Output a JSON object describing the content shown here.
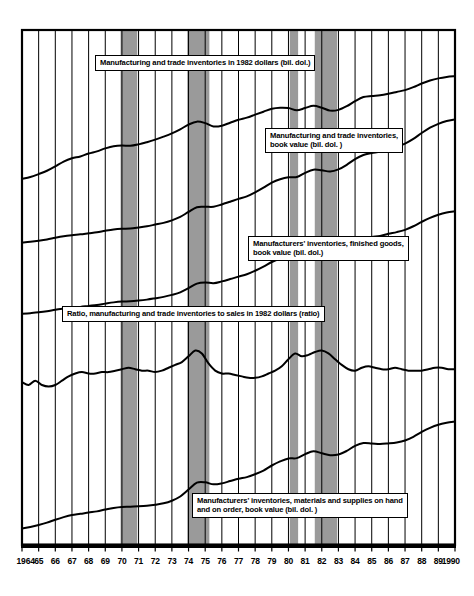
{
  "figure": {
    "background": "#ffffff",
    "plot_frame_color": "#000000",
    "grid_color": "#000000",
    "recession_fill": "#9a9a9a",
    "line_color": "#000000"
  },
  "chart_data": {
    "type": "line",
    "title": "",
    "subtitle": "",
    "xlabel": "",
    "ylabel": "",
    "grid": true,
    "legend_position": "inline-labels",
    "xlim": [
      1964,
      1990
    ],
    "x_tick_labels": [
      "1964",
      "65",
      "66",
      "67",
      "68",
      "69",
      "70",
      "71",
      "72",
      "73",
      "74",
      "75",
      "76",
      "77",
      "78",
      "79",
      "80",
      "81",
      "82",
      "83",
      "84",
      "85",
      "86",
      "87",
      "88",
      "89",
      "1990"
    ],
    "x_ticks": [
      1964,
      1965,
      1966,
      1967,
      1968,
      1969,
      1970,
      1971,
      1972,
      1973,
      1974,
      1975,
      1976,
      1977,
      1978,
      1979,
      1980,
      1981,
      1982,
      1983,
      1984,
      1985,
      1986,
      1987,
      1988,
      1989,
      1990
    ],
    "shaded_bands": [
      {
        "name": "recession-1969-1970",
        "start": 1969.92,
        "end": 1970.92
      },
      {
        "name": "recession-1973-1975",
        "start": 1973.92,
        "end": 1975.25
      },
      {
        "name": "recession-1980",
        "start": 1980.08,
        "end": 1980.58
      },
      {
        "name": "recession-1981-1982",
        "start": 1981.58,
        "end": 1982.92
      }
    ],
    "series": [
      {
        "name": "Manufacturing and trade inventories in 1982 dollars (bil. dol.)",
        "id": "mfg-trade-inv-1982-dollars",
        "x": [
          1964.0,
          1964.5,
          1965.0,
          1965.5,
          1966.0,
          1966.5,
          1967.0,
          1967.5,
          1968.0,
          1968.5,
          1969.0,
          1969.5,
          1970.0,
          1970.5,
          1971.0,
          1971.5,
          1972.0,
          1972.5,
          1973.0,
          1973.5,
          1974.0,
          1974.5,
          1975.0,
          1975.5,
          1976.0,
          1976.5,
          1977.0,
          1977.5,
          1978.0,
          1978.5,
          1979.0,
          1979.5,
          1980.0,
          1980.5,
          1981.0,
          1981.5,
          1982.0,
          1982.5,
          1983.0,
          1983.5,
          1984.0,
          1984.5,
          1985.0,
          1985.5,
          1986.0,
          1986.5,
          1987.0,
          1987.5,
          1988.0,
          1988.5,
          1989.0,
          1989.5,
          1990.0
        ],
        "y": [
          218,
          223,
          231,
          240,
          252,
          265,
          274,
          279,
          287,
          293,
          301,
          307,
          309,
          308,
          312,
          318,
          325,
          333,
          342,
          353,
          366,
          374,
          370,
          361,
          363,
          371,
          379,
          385,
          393,
          401,
          409,
          412,
          411,
          405,
          411,
          417,
          412,
          404,
          406,
          416,
          430,
          441,
          444,
          446,
          450,
          455,
          460,
          468,
          478,
          486,
          492,
          496,
          498
        ]
      },
      {
        "name": "Manufacturing and trade inventories, book value (bil. dol. )",
        "id": "mfg-trade-inv-book-value",
        "x": [
          1964.0,
          1964.5,
          1965.0,
          1965.5,
          1966.0,
          1966.5,
          1967.0,
          1967.5,
          1968.0,
          1968.5,
          1969.0,
          1969.5,
          1970.0,
          1970.5,
          1971.0,
          1971.5,
          1972.0,
          1972.5,
          1973.0,
          1973.5,
          1974.0,
          1974.5,
          1975.0,
          1975.5,
          1976.0,
          1976.5,
          1977.0,
          1977.5,
          1978.0,
          1978.5,
          1979.0,
          1979.5,
          1980.0,
          1980.5,
          1981.0,
          1981.5,
          1982.0,
          1982.5,
          1983.0,
          1983.5,
          1984.0,
          1984.5,
          1985.0,
          1985.5,
          1986.0,
          1986.5,
          1987.0,
          1987.5,
          1988.0,
          1988.5,
          1989.0,
          1989.5,
          1990.0
        ],
        "y": [
          103,
          107,
          112,
          118,
          126,
          133,
          138,
          142,
          147,
          152,
          159,
          165,
          168,
          169,
          174,
          180,
          188,
          196,
          208,
          224,
          248,
          270,
          272,
          272,
          283,
          296,
          309,
          321,
          340,
          362,
          386,
          402,
          411,
          412,
          432,
          447,
          444,
          438,
          448,
          470,
          497,
          516,
          525,
          533,
          545,
          556,
          570,
          592,
          620,
          645,
          663,
          676,
          684
        ]
      },
      {
        "name": "Manufacturers' inventories, finished goods, book value (bil. dol.)",
        "id": "mfr-inv-finished-goods-book-value",
        "x": [
          1964.0,
          1964.5,
          1965.0,
          1965.5,
          1966.0,
          1966.5,
          1967.0,
          1967.5,
          1968.0,
          1968.5,
          1969.0,
          1969.5,
          1970.0,
          1970.5,
          1971.0,
          1971.5,
          1972.0,
          1972.5,
          1973.0,
          1973.5,
          1974.0,
          1974.5,
          1975.0,
          1975.5,
          1976.0,
          1976.5,
          1977.0,
          1977.5,
          1978.0,
          1978.5,
          1979.0,
          1979.5,
          1980.0,
          1980.5,
          1981.0,
          1981.5,
          1982.0,
          1982.5,
          1983.0,
          1983.5,
          1984.0,
          1984.5,
          1985.0,
          1985.5,
          1986.0,
          1986.5,
          1987.0,
          1987.5,
          1988.0,
          1988.5,
          1989.0,
          1989.5,
          1990.0
        ],
        "y": [
          20.5,
          21.3,
          22.2,
          23.4,
          25.0,
          26.3,
          27.5,
          28.3,
          29.4,
          30.5,
          32.0,
          33.4,
          34.3,
          34.6,
          35.4,
          36.5,
          38.0,
          39.6,
          41.8,
          44.6,
          49.4,
          54.5,
          55.8,
          55.0,
          57.0,
          59.6,
          62.4,
          65.0,
          69.0,
          73.6,
          78.8,
          82.5,
          85.0,
          85.4,
          89.6,
          93.0,
          92.4,
          90.6,
          92.2,
          96.0,
          101.5,
          105.5,
          107.0,
          108.0,
          110.5,
          112.4,
          115.0,
          119.0,
          124.0,
          128.5,
          132.0,
          134.5,
          136.0
        ]
      },
      {
        "name": "Ratio, manufacturing and trade inventories to sales in 1982 dollars (ratio)",
        "id": "inventory-to-sales-ratio",
        "x": [
          1964.0,
          1964.4,
          1964.8,
          1965.2,
          1965.6,
          1966.0,
          1966.4,
          1966.8,
          1967.2,
          1967.6,
          1968.0,
          1968.4,
          1968.8,
          1969.2,
          1969.6,
          1970.0,
          1970.4,
          1970.8,
          1971.2,
          1971.6,
          1972.0,
          1972.4,
          1972.8,
          1973.2,
          1973.6,
          1974.0,
          1974.4,
          1974.8,
          1975.2,
          1975.6,
          1976.0,
          1976.4,
          1976.8,
          1977.2,
          1977.6,
          1978.0,
          1978.4,
          1978.8,
          1979.2,
          1979.6,
          1980.0,
          1980.4,
          1980.8,
          1981.2,
          1981.6,
          1982.0,
          1982.4,
          1982.8,
          1983.2,
          1983.6,
          1984.0,
          1984.4,
          1984.8,
          1985.2,
          1985.6,
          1986.0,
          1986.4,
          1986.8,
          1987.2,
          1987.6,
          1988.0,
          1988.4,
          1988.8,
          1989.2,
          1989.6,
          1990.0
        ],
        "y": [
          1.52,
          1.5,
          1.53,
          1.5,
          1.49,
          1.5,
          1.53,
          1.56,
          1.58,
          1.59,
          1.58,
          1.58,
          1.59,
          1.59,
          1.6,
          1.61,
          1.62,
          1.61,
          1.6,
          1.6,
          1.59,
          1.6,
          1.62,
          1.64,
          1.66,
          1.7,
          1.74,
          1.72,
          1.65,
          1.6,
          1.58,
          1.58,
          1.57,
          1.56,
          1.55,
          1.55,
          1.56,
          1.58,
          1.6,
          1.63,
          1.68,
          1.72,
          1.7,
          1.71,
          1.73,
          1.74,
          1.72,
          1.68,
          1.64,
          1.61,
          1.6,
          1.62,
          1.63,
          1.62,
          1.61,
          1.61,
          1.62,
          1.61,
          1.6,
          1.6,
          1.6,
          1.61,
          1.62,
          1.62,
          1.61,
          1.61
        ]
      },
      {
        "name": "Manufacturers' inventories, materials and supplies on hand and on order, book value (bil. dol. )",
        "id": "mfr-inv-materials-supplies-book-value",
        "x": [
          1964.0,
          1964.5,
          1965.0,
          1965.5,
          1966.0,
          1966.5,
          1967.0,
          1967.5,
          1968.0,
          1968.5,
          1969.0,
          1969.5,
          1970.0,
          1970.5,
          1971.0,
          1971.5,
          1972.0,
          1972.5,
          1973.0,
          1973.5,
          1974.0,
          1974.5,
          1975.0,
          1975.5,
          1976.0,
          1976.5,
          1977.0,
          1977.5,
          1978.0,
          1978.5,
          1979.0,
          1979.5,
          1980.0,
          1980.5,
          1981.0,
          1981.5,
          1982.0,
          1982.5,
          1983.0,
          1983.5,
          1984.0,
          1984.5,
          1985.0,
          1985.5,
          1986.0,
          1986.5,
          1987.0,
          1987.5,
          1988.0,
          1988.5,
          1989.0,
          1989.5,
          1990.0
        ],
        "y": [
          16.0,
          17.0,
          18.2,
          19.6,
          21.4,
          23.0,
          24.3,
          25.0,
          25.8,
          26.5,
          27.6,
          28.6,
          29.2,
          29.3,
          29.6,
          30.0,
          30.6,
          31.4,
          33.0,
          35.6,
          39.8,
          44.0,
          44.2,
          43.0,
          43.6,
          45.0,
          46.4,
          47.4,
          49.2,
          51.4,
          54.5,
          57.0,
          58.8,
          59.0,
          61.4,
          63.2,
          62.0,
          60.8,
          61.2,
          63.4,
          66.5,
          68.2,
          68.0,
          67.6,
          68.0,
          68.6,
          69.8,
          72.0,
          75.0,
          77.5,
          79.4,
          80.6,
          81.4
        ]
      }
    ]
  },
  "labels": [
    {
      "id": "label-mfg-trade-inv-1982-dollars",
      "lines": [
        "Manufacturing and trade inventories in 1982 dollars (bil. dol.)"
      ]
    },
    {
      "id": "label-mfg-trade-inv-book-value",
      "lines": [
        "Manufacturing and trade inventories,",
        "book value (bil. dol. )"
      ]
    },
    {
      "id": "label-mfr-inv-finished-goods",
      "lines": [
        "Manufacturers' inventories, finished goods,",
        "book value (bil. dol.)"
      ]
    },
    {
      "id": "label-inventory-to-sales-ratio",
      "lines": [
        "Ratio, manufacturing and trade inventories to sales in 1982 dollars (ratio)"
      ]
    },
    {
      "id": "label-mfr-inv-materials-supplies",
      "lines": [
        "Manufacturers' inventories, materials and supplies on hand",
        "and on order, book value (bil. dol. )"
      ]
    }
  ]
}
